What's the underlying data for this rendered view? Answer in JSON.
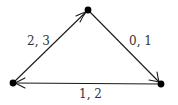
{
  "diagram": {
    "type": "directed-graph",
    "nodes": [
      {
        "id": "top",
        "x": 88,
        "y": 10
      },
      {
        "id": "bottom-left",
        "x": 13,
        "y": 83
      },
      {
        "id": "bottom-right",
        "x": 161,
        "y": 84
      }
    ],
    "edges": [
      {
        "from": "bottom-left",
        "to": "top",
        "label": "2, 3"
      },
      {
        "from": "top",
        "to": "bottom-right",
        "label": "0, 1"
      },
      {
        "from": "bottom-right",
        "to": "bottom-left",
        "label": "1, 2"
      }
    ],
    "colors": {
      "stroke": "#1a1a1a",
      "node": "#000000",
      "label": "#333333"
    }
  }
}
